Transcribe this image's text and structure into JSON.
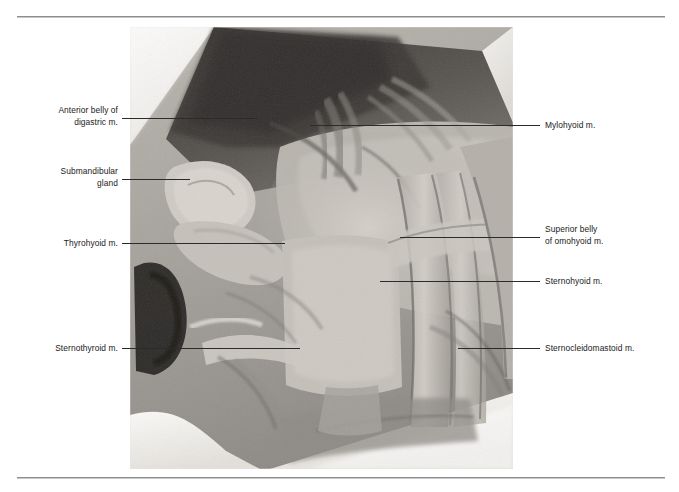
{
  "figure": {
    "kind": "anatomical-photograph",
    "photo": {
      "left": 130,
      "top": 27,
      "width": 383,
      "height": 442,
      "palette": {
        "cloth_white": "#f2f0ee",
        "tissue_light": "#c9c5bf",
        "tissue_mid": "#9d9a95",
        "tissue_dark": "#6b6864",
        "shadow_black": "#23211f",
        "muscle_highlight": "#d8d4ce"
      }
    },
    "rules": {
      "top": {
        "x": 17,
        "y": 16,
        "width": 648
      },
      "bottom": {
        "x": 17,
        "y": 477,
        "width": 648
      }
    }
  },
  "labels": [
    {
      "id": "anterior-belly-of-digastric",
      "text": "Anterior belly of\ndigastric m.",
      "side": "left",
      "text_right": 118,
      "text_top": 105,
      "leader": {
        "x": 122,
        "y": 118,
        "width": 136
      }
    },
    {
      "id": "submandibular-gland",
      "text": "Submandibular\ngland",
      "side": "left",
      "text_right": 118,
      "text_top": 166,
      "leader": {
        "x": 122,
        "y": 179,
        "width": 68
      }
    },
    {
      "id": "thyrohyoid",
      "text": "Thyrohyoid m.",
      "side": "left",
      "text_right": 118,
      "text_top": 238,
      "leader": {
        "x": 122,
        "y": 243,
        "width": 163
      }
    },
    {
      "id": "sternothyroid",
      "text": "Sternothyroid m.",
      "side": "left",
      "text_right": 118,
      "text_top": 343,
      "leader": {
        "x": 122,
        "y": 348,
        "width": 178
      }
    },
    {
      "id": "mylohyoid",
      "text": "Mylohyoid m.",
      "side": "right",
      "text_left": 545,
      "text_top": 120,
      "leader": {
        "x": 310,
        "y": 125,
        "width": 230
      }
    },
    {
      "id": "superior-belly-of-omohyoid",
      "text": "Superior belly\nof omohyoid m.",
      "side": "right",
      "text_left": 545,
      "text_top": 224,
      "leader": {
        "x": 400,
        "y": 237,
        "width": 140
      }
    },
    {
      "id": "sternohyoid",
      "text": "Sternohyoid m.",
      "side": "right",
      "text_left": 545,
      "text_top": 276,
      "leader": {
        "x": 380,
        "y": 281,
        "width": 160
      }
    },
    {
      "id": "sternocleidomastoid",
      "text": "Sternocleidomastoid m.",
      "side": "right",
      "text_left": 545,
      "text_top": 343,
      "leader": {
        "x": 458,
        "y": 348,
        "width": 82
      }
    }
  ]
}
